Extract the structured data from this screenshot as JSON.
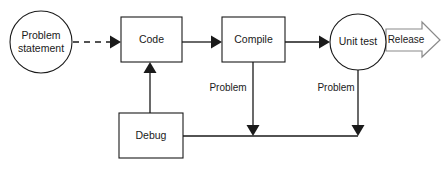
{
  "diagram": {
    "colors": {
      "stroke": "#1a1a1a",
      "release_stroke": "#8a8a8a",
      "fill": "#ffffff",
      "background": "#ffffff"
    },
    "nodes": [
      {
        "id": "problem-statement",
        "shape": "circle",
        "label_line1": "Problem",
        "label_line2": "statement",
        "cx": 41,
        "cy": 42,
        "r": 31
      },
      {
        "id": "code",
        "shape": "rect",
        "label": "Code",
        "x": 121,
        "y": 17,
        "w": 61,
        "h": 45
      },
      {
        "id": "compile",
        "shape": "rect",
        "label": "Compile",
        "x": 222,
        "y": 17,
        "w": 63,
        "h": 45
      },
      {
        "id": "unit-test",
        "shape": "circle",
        "label": "Unit test",
        "cx": 358,
        "cy": 42,
        "r": 28
      },
      {
        "id": "debug",
        "shape": "rect",
        "label": "Debug",
        "x": 119,
        "y": 113,
        "w": 64,
        "h": 45
      },
      {
        "id": "release",
        "shape": "block-arrow",
        "label": "Release"
      }
    ],
    "edges": [
      {
        "id": "problem-statement-to-code",
        "from": "problem-statement",
        "to": "code",
        "style": "dashed",
        "label": ""
      },
      {
        "id": "code-to-compile",
        "from": "code",
        "to": "compile",
        "style": "solid",
        "label": ""
      },
      {
        "id": "compile-to-unit-test",
        "from": "compile",
        "to": "unit-test",
        "style": "solid",
        "label": ""
      },
      {
        "id": "unit-test-to-release",
        "from": "unit-test",
        "to": "release",
        "style": "block-arrow",
        "label": "Release"
      },
      {
        "id": "compile-problem-to-debug",
        "from": "compile",
        "to": "debug",
        "style": "solid",
        "label": "Problem"
      },
      {
        "id": "unit-test-problem-to-debug",
        "from": "unit-test",
        "to": "debug",
        "style": "solid",
        "label": "Problem"
      },
      {
        "id": "debug-to-code",
        "from": "debug",
        "to": "code",
        "style": "solid",
        "label": ""
      }
    ],
    "labels": {
      "problem_statement_l1": "Problem",
      "problem_statement_l2": "statement",
      "code": "Code",
      "compile": "Compile",
      "unit_test": "Unit test",
      "debug": "Debug",
      "release": "Release",
      "problem_compile": "Problem",
      "problem_unit_test": "Problem"
    }
  }
}
